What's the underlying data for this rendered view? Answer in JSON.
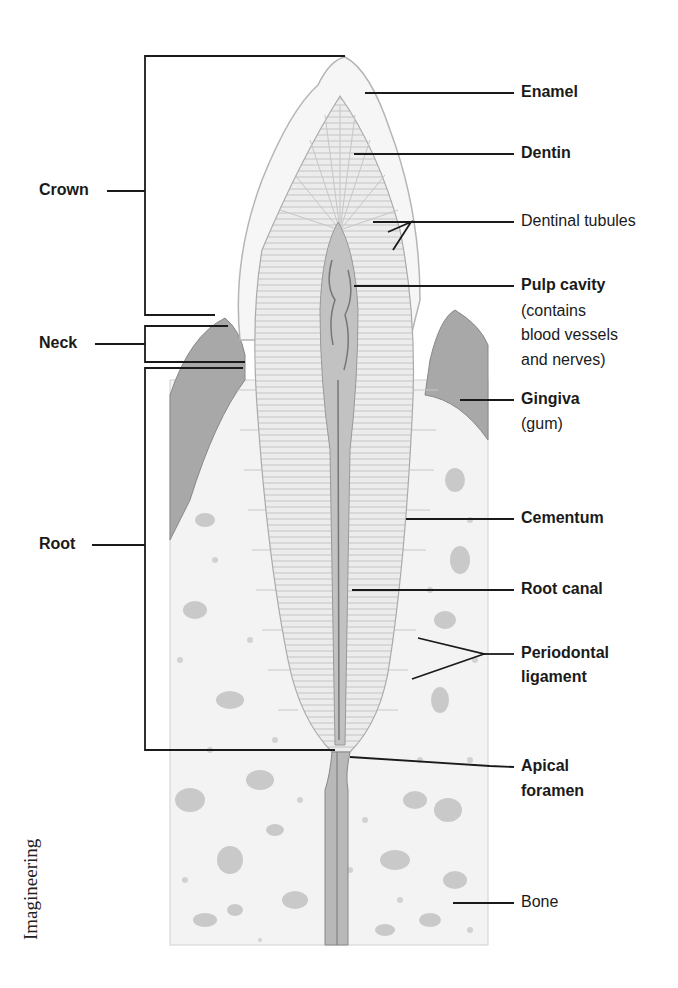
{
  "diagram": {
    "colors": {
      "line": "#1a1a1a",
      "gum": "#9a9a9a",
      "bone_bg": "#f1f1f1",
      "dentin": "#e6e6e6",
      "pulp": "#bdbdbd"
    },
    "left_labels": {
      "crown": "Crown",
      "neck": "Neck",
      "root": "Root"
    },
    "right_labels": {
      "enamel": "Enamel",
      "dentin": "Dentin",
      "dentinal_tubules": "Dentinal tubules",
      "pulp_cavity": "Pulp cavity",
      "pulp_note_1": "(contains",
      "pulp_note_2": "blood vessels",
      "pulp_note_3": "and nerves)",
      "gingiva": "Gingiva",
      "gingiva_note": "(gum)",
      "cementum": "Cementum",
      "root_canal": "Root canal",
      "periodontal_1": "Periodontal",
      "periodontal_2": "ligament",
      "apical_1": "Apical",
      "apical_2": "foramen",
      "bone": "Bone"
    },
    "credit": "Imagineering"
  }
}
